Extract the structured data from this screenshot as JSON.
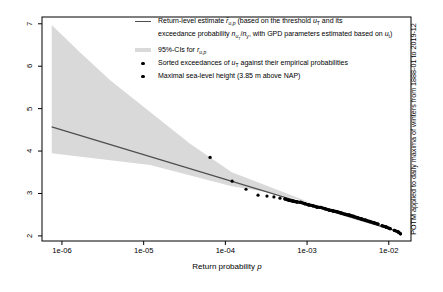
{
  "colors": {
    "band": "#d9d9d9",
    "line": "#4d4d4d",
    "points": "#000000",
    "axis": "#000000"
  },
  "right_label": "POTM applied to daily maxima of winters from 1888-01 to 2019-12",
  "legend": {
    "items": [
      {
        "swatch": "line",
        "text_html": "Return-level estimate <i>r&#770;</i><sub><i>u</i>,<i>p</i></sub> (based on the threshold <i>u</i><sub>T</sub> and its<br>exceedance probability <i>n</i><sub><i>u</i><sub>T</sub></sub>/<i>n</i><sub>y</sub>, with GPD parameters estimated based on <i>u</i><sub>t</sub>)"
      },
      {
        "swatch": "band",
        "text_html": "95%-CIs for <i>r</i><sub><i>u</i>,<i>p</i></sub>"
      },
      {
        "swatch": "point",
        "text_html": "Sorted exceedances of <i>u</i><sub>T</sub> against their empirical probabilities"
      },
      {
        "swatch": "point",
        "text_html": "Maximal sea-level height (3.85 m above NAP)"
      }
    ]
  },
  "chart_data": {
    "type": "line",
    "title": "",
    "xlabel_html": "Return probability <i>p</i>",
    "x_scale": "log10",
    "grid": false,
    "legend_position": "top-center-inside",
    "xlim": [
      5.7e-07,
      0.0187
    ],
    "ylim": [
      1.88,
      7.16
    ],
    "x_tick_values": [
      1e-06,
      1e-05,
      0.0001,
      0.001,
      0.01
    ],
    "x_tick_labels": [
      "1e-06",
      "1e-05",
      "1e-04",
      "1e-03",
      "1e-02"
    ],
    "y_tick_values": [
      2,
      3,
      4,
      5,
      6,
      7
    ],
    "y_tick_labels": [
      "2",
      "3",
      "4",
      "5",
      "6",
      "7"
    ],
    "return_level_line": {
      "name": "Return-level estimate",
      "points": [
        [
          7.5e-07,
          4.57
        ],
        [
          0.0137,
          2.09
        ]
      ]
    },
    "ci_band": {
      "name": "95%-CIs",
      "upper": [
        [
          7.5e-07,
          6.97
        ],
        [
          1.66e-06,
          6.33
        ],
        [
          3.9e-06,
          5.67
        ],
        [
          1.2e-05,
          4.92
        ],
        [
          3.7e-05,
          4.17
        ],
        [
          0.00012,
          3.5
        ],
        [
          0.00038,
          3.13
        ],
        [
          0.00115,
          2.77
        ]
      ],
      "lower": [
        [
          7.5e-07,
          3.95
        ],
        [
          1.2e-05,
          3.67
        ],
        [
          0.00012,
          3.17
        ],
        [
          0.00038,
          3.01
        ],
        [
          0.00115,
          2.77
        ]
      ]
    },
    "exceedance_points": [
      [
        0.000121,
        3.29
      ],
      [
        0.000179,
        3.1
      ],
      [
        0.000251,
        2.96
      ],
      [
        0.000323,
        2.94
      ],
      [
        0.000393,
        2.92
      ],
      [
        0.000466,
        2.89
      ],
      [
        0.000536,
        2.87
      ],
      [
        0.0006,
        2.84
      ],
      [
        0.00067,
        2.82
      ],
      [
        0.00075,
        2.8
      ],
      [
        0.00084,
        2.79
      ],
      [
        0.00094,
        2.76
      ],
      [
        0.00105,
        2.73
      ],
      [
        0.00118,
        2.71
      ],
      [
        0.00132,
        2.68
      ],
      [
        0.00148,
        2.67
      ],
      [
        0.00166,
        2.64
      ],
      [
        0.00186,
        2.61
      ],
      [
        0.00208,
        2.59
      ],
      [
        0.00234,
        2.57
      ],
      [
        0.00262,
        2.54
      ],
      [
        0.00294,
        2.51
      ],
      [
        0.00329,
        2.49
      ],
      [
        0.0037,
        2.46
      ],
      [
        0.00415,
        2.43
      ],
      [
        0.00465,
        2.4
      ],
      [
        0.00522,
        2.37
      ],
      [
        0.00586,
        2.34
      ],
      [
        0.00657,
        2.31
      ],
      [
        0.00738,
        2.28
      ],
      [
        0.00828,
        2.24
      ],
      [
        0.00929,
        2.21
      ],
      [
        0.0104,
        2.17
      ],
      [
        0.0117,
        2.13
      ],
      [
        0.0131,
        2.09
      ],
      [
        0.0139,
        2.05
      ]
    ],
    "max_point": [
      6.5e-05,
      3.85
    ]
  }
}
